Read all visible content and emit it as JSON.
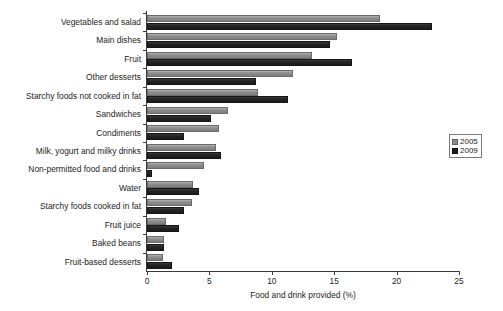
{
  "chart_data": {
    "type": "bar",
    "orientation": "horizontal",
    "title": "",
    "xlabel": "Food and drink provided (%)",
    "ylabel": "",
    "xlim": [
      0,
      25
    ],
    "xticks": [
      0,
      5,
      10,
      15,
      20,
      25
    ],
    "grid": false,
    "legend_position": "right",
    "categories": [
      "Vegetables and salad",
      "Main dishes",
      "Fruit",
      "Other desserts",
      "Starchy foods not cooked in fat",
      "Sandwiches",
      "Condiments",
      "Milk, yogurt and milky drinks",
      "Non-permitted food and drinks",
      "Water",
      "Starchy foods cooked in fat",
      "Fruit juice",
      "Baked beans",
      "Fruit-based desserts"
    ],
    "series": [
      {
        "name": "2005",
        "color": "#8c8c8c",
        "values": [
          18.7,
          15.2,
          13.2,
          11.7,
          8.9,
          6.5,
          5.8,
          5.5,
          4.6,
          3.7,
          3.6,
          1.5,
          1.4,
          1.3
        ]
      },
      {
        "name": "2009",
        "color": "#1e1e1e",
        "values": [
          22.8,
          14.7,
          16.4,
          8.7,
          11.3,
          5.1,
          3.0,
          5.9,
          0.4,
          4.2,
          3.0,
          2.6,
          1.4,
          2.0
        ]
      }
    ]
  },
  "legend": {
    "entries": [
      {
        "label": "2005"
      },
      {
        "label": "2009"
      }
    ]
  }
}
